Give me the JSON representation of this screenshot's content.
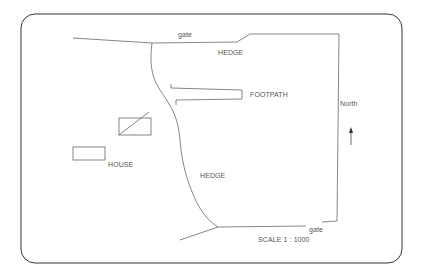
{
  "diagram": {
    "type": "site-plan",
    "labels": {
      "gate_top": "gate",
      "hedge_top": "HEDGE",
      "footpath": "FOOTPATH",
      "north": "North",
      "house": "HOUSE",
      "hedge_middle": "HEDGE",
      "gate_bottom": "gate",
      "scale": "SCALE 1 : 1000"
    },
    "colors": {
      "frame": "#333333",
      "lines": "#666666",
      "text": "#555555",
      "background": "#ffffff"
    }
  }
}
